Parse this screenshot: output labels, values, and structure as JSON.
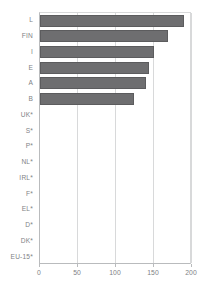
{
  "chart_data": {
    "type": "bar",
    "orientation": "horizontal",
    "title": "",
    "subtitle": "",
    "xlabel": "",
    "ylabel": "",
    "xlim": [
      0,
      200
    ],
    "xticks": [
      0,
      50,
      100,
      150,
      200
    ],
    "xtick_labels": [
      "0",
      "50",
      "100",
      "150",
      "200"
    ],
    "grid": true,
    "grid_axis": "x",
    "legend": false,
    "legend_position": "none",
    "bar_color": "#6e6e70",
    "categories": [
      "L",
      "FIN",
      "I",
      "E",
      "A",
      "B",
      "UK*",
      "S*",
      "P*",
      "NL*",
      "IRL*",
      "F*",
      "EL*",
      "D*",
      "DK*",
      "EU-15*"
    ],
    "values": [
      189,
      168,
      150,
      144,
      140,
      124,
      null,
      null,
      null,
      null,
      null,
      null,
      null,
      null,
      null,
      null
    ],
    "note": "Categories marked with * have no data plotted"
  },
  "axis": {
    "x_ticks": [
      {
        "label": "0",
        "value": 0
      },
      {
        "label": "50",
        "value": 50
      },
      {
        "label": "100",
        "value": 100
      },
      {
        "label": "150",
        "value": 150
      },
      {
        "label": "200",
        "value": 200
      }
    ]
  },
  "colors": {
    "bar_fill": "#6e6e70",
    "bar_edge": "#5c5c5e",
    "grid": "#d8d9da",
    "axis": "#b9bbbd",
    "text": "#808285",
    "background": "#ffffff"
  }
}
